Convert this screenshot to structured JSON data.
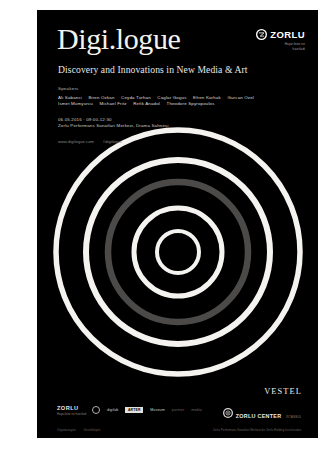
{
  "poster": {
    "background_color": "#000000",
    "page_background": "#ffffff",
    "title": "Digi.logue",
    "subtitle": "Discovery and Innovations in New Media & Art"
  },
  "speakers": {
    "label": "Speakers",
    "row1": [
      "Ali Sabanci",
      "Biren Ozkan",
      "Ceyda Turhan",
      "Caglar Gogus",
      "Efren Karhak",
      "Gurcan Ozel"
    ],
    "row2": [
      "Ismet Mumyurcu",
      "Michael Fritz",
      "Refik Anadol",
      "Theodore Spyropoulos"
    ]
  },
  "event_info": {
    "line1": "06.05.2016 · 09:00-12:30",
    "line2": "Zorlu Performans Sanatlari Merkezi, Drama Sahnesi"
  },
  "urls": {
    "primary": "www.digilogue.com",
    "secondary": "#digilogue"
  },
  "zorlu_top": {
    "icon": "zorlu-circle-mark",
    "wordmark": "ZORLU",
    "tagline_line1": "Hayat bize ne",
    "tagline_line2": "hazirladi"
  },
  "rings": {
    "center_x": 141,
    "center_y": 242,
    "white_color": "#f5f3f0",
    "grey_color": "#4c4a48",
    "circles": [
      {
        "radius": 21,
        "stroke": 4.0,
        "color": "white"
      },
      {
        "radius": 44,
        "stroke": 5.0,
        "color": "white"
      },
      {
        "radius": 70,
        "stroke": 6.5,
        "color": "grey"
      },
      {
        "radius": 92,
        "stroke": 6.0,
        "color": "white"
      },
      {
        "radius": 122,
        "stroke": 5.5,
        "color": "white"
      }
    ]
  },
  "footer": {
    "zorlu_block": {
      "wordmark": "ZORLU",
      "subtitle": "Hayat bize ne hazirladi"
    },
    "sponsors": [
      {
        "name": "ring-logo",
        "label": "",
        "style": "ring"
      },
      {
        "name": "digilab",
        "label": "digilab",
        "style": "text"
      },
      {
        "name": "arter",
        "label": "ARTER",
        "style": "badge"
      },
      {
        "name": "museum",
        "label": "Museum",
        "style": "text"
      },
      {
        "name": "partner-a",
        "label": "partner",
        "style": "dim"
      },
      {
        "name": "partner-b",
        "label": "media",
        "style": "dim"
      }
    ],
    "credits": [
      "Organizasyon",
      "Destekleyen"
    ],
    "vestel": "VESTEL",
    "zorlu_center": {
      "icon": "zorlu-center-mark",
      "wordmark": "ZORLU CENTER",
      "subtitle": "ISTANBUL"
    },
    "right_note": "Zorlu Performans Sanatlari Merkezi bir Zorlu Holding kurulusudur."
  }
}
